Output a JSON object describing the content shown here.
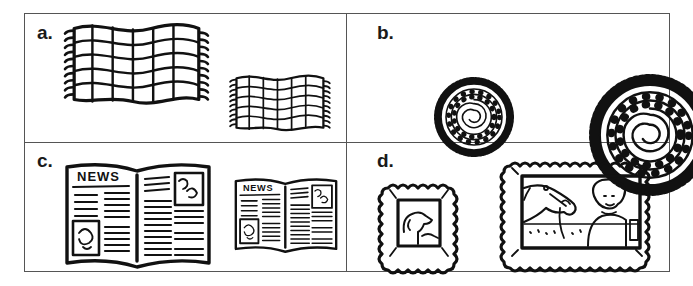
{
  "figure": {
    "type": "2x2 comparison grid",
    "ink_color": "#111111",
    "border_color": "#555555",
    "cells": [
      {
        "label": "a.",
        "subject": "rectangular fringed rug",
        "items": [
          {
            "size": "large",
            "icon": "rug-rectangular-icon"
          },
          {
            "size": "small",
            "icon": "rug-rectangular-icon"
          }
        ]
      },
      {
        "label": "b.",
        "subject": "round braided rug",
        "items": [
          {
            "size": "small",
            "icon": "rug-round-icon"
          },
          {
            "size": "large",
            "icon": "rug-round-icon"
          }
        ]
      },
      {
        "label": "c.",
        "subject": "open newspaper",
        "masthead": "NEWS",
        "items": [
          {
            "size": "large",
            "icon": "newspaper-icon"
          },
          {
            "size": "small",
            "icon": "newspaper-icon"
          }
        ]
      },
      {
        "label": "d.",
        "subject": "framed picture",
        "items": [
          {
            "size": "small",
            "icon": "framed-dog-picture-icon"
          },
          {
            "size": "large",
            "icon": "framed-horse-and-person-picture-icon"
          }
        ]
      }
    ]
  }
}
